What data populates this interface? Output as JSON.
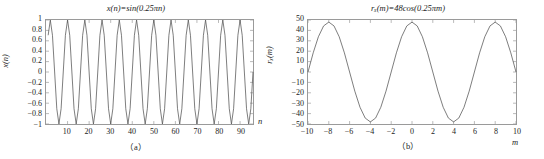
{
  "figure": {
    "panels": [
      {
        "caption": "（a）",
        "title_parts": {
          "func": "x",
          "arg": "n",
          "eq": "=sin(0.25π",
          "argend": "n)"
        },
        "title_text": "x(n)=sin(0.25πn)",
        "ylabel": "x(n)",
        "xlabel": "n",
        "yticks": [
          "1",
          "0.8",
          "0.6",
          "0.4",
          "0.2",
          "0",
          "−0.2",
          "−0.4",
          "−0.6",
          "−0.8",
          "−1"
        ],
        "xticks": [
          "10",
          "20",
          "30",
          "40",
          "50",
          "60",
          "70",
          "80",
          "90"
        ]
      },
      {
        "caption": "（b）",
        "title_text": "rₓ(m)=48cos(0.25πm)",
        "ylabel": "rₓ(m)",
        "xlabel": "m",
        "yticks": [
          "50",
          "40",
          "30",
          "20",
          "10",
          "0",
          "−10",
          "−20",
          "−30",
          "−40",
          "−50"
        ],
        "xticks": [
          "−10",
          "−8",
          "−6",
          "−4",
          "−2",
          "0",
          "2",
          "4",
          "6",
          "8",
          "10"
        ]
      }
    ]
  },
  "chart_data": [
    {
      "type": "line",
      "title": "x(n)=sin(0.25πn)",
      "xlabel": "n",
      "ylabel": "x(n)",
      "xlim": [
        0,
        96
      ],
      "ylim": [
        -1,
        1
      ],
      "xticks": [
        10,
        20,
        30,
        40,
        50,
        60,
        70,
        80,
        90
      ],
      "yticks": [
        -1,
        -0.8,
        -0.6,
        -0.4,
        -0.2,
        0,
        0.2,
        0.4,
        0.6,
        0.8,
        1
      ],
      "grid": false,
      "legend": null,
      "formula": "x(n) = sin(0.25*pi*n)",
      "sample_period": 8,
      "amplitude": 1,
      "n_cycles": 12,
      "series": [
        {
          "name": "x(n)",
          "color": "#5a5a5a",
          "x": [
            1,
            2,
            3,
            4,
            5,
            6,
            7,
            8,
            9,
            10,
            11,
            12,
            13,
            14,
            15,
            16,
            17,
            18,
            19,
            20,
            21,
            22,
            23,
            24,
            25,
            26,
            27,
            28,
            29,
            30,
            31,
            32,
            33,
            34,
            35,
            36,
            37,
            38,
            39,
            40,
            41,
            42,
            43,
            44,
            45,
            46,
            47,
            48,
            49,
            50,
            51,
            52,
            53,
            54,
            55,
            56,
            57,
            58,
            59,
            60,
            61,
            62,
            63,
            64,
            65,
            66,
            67,
            68,
            69,
            70,
            71,
            72,
            73,
            74,
            75,
            76,
            77,
            78,
            79,
            80,
            81,
            82,
            83,
            84,
            85,
            86,
            87,
            88,
            89,
            90,
            91,
            92,
            93,
            94,
            95,
            96
          ],
          "y": [
            0.707,
            1,
            0.707,
            0,
            -0.707,
            -1,
            -0.707,
            0,
            0.707,
            1,
            0.707,
            0,
            -0.707,
            -1,
            -0.707,
            0,
            0.707,
            1,
            0.707,
            0,
            -0.707,
            -1,
            -0.707,
            0,
            0.707,
            1,
            0.707,
            0,
            -0.707,
            -1,
            -0.707,
            0,
            0.707,
            1,
            0.707,
            0,
            -0.707,
            -1,
            -0.707,
            0,
            0.707,
            1,
            0.707,
            0,
            -0.707,
            -1,
            -0.707,
            0,
            0.707,
            1,
            0.707,
            0,
            -0.707,
            -1,
            -0.707,
            0,
            0.707,
            1,
            0.707,
            0,
            -0.707,
            -1,
            -0.707,
            0,
            0.707,
            1,
            0.707,
            0,
            -0.707,
            -1,
            -0.707,
            0,
            0.707,
            1,
            0.707,
            0,
            -0.707,
            -1,
            -0.707,
            0,
            0.707,
            1,
            0.707,
            0,
            -0.707,
            -1,
            -0.707,
            0,
            0.707,
            1,
            0.707,
            0,
            -0.707,
            -1,
            -0.707,
            0
          ]
        }
      ]
    },
    {
      "type": "line",
      "title": "rₓ(m)=48cos(0.25πm)",
      "xlabel": "m",
      "ylabel": "rₓ(m)",
      "xlim": [
        -10,
        10
      ],
      "ylim": [
        -50,
        50
      ],
      "xticks": [
        -10,
        -8,
        -6,
        -4,
        -2,
        0,
        2,
        4,
        6,
        8,
        10
      ],
      "yticks": [
        -50,
        -40,
        -30,
        -20,
        -10,
        0,
        10,
        20,
        30,
        40,
        50
      ],
      "grid": false,
      "legend": null,
      "formula": "r_x(m) = 48*cos(0.25*pi*m)",
      "amplitude": 48,
      "period": 8,
      "series": [
        {
          "name": "rₓ(m)",
          "color": "#5a5a5a",
          "x": [
            -10,
            -9.5,
            -9,
            -8.5,
            -8,
            -7.5,
            -7,
            -6.5,
            -6,
            -5.5,
            -5,
            -4.5,
            -4,
            -3.5,
            -3,
            -2.5,
            -2,
            -1.5,
            -1,
            -0.5,
            0,
            0.5,
            1,
            1.5,
            2,
            2.5,
            3,
            3.5,
            4,
            4.5,
            5,
            5.5,
            6,
            6.5,
            7,
            7.5,
            8,
            8.5,
            9,
            9.5,
            10
          ],
          "y": [
            0,
            18.4,
            33.9,
            44.3,
            48,
            44.3,
            33.9,
            18.4,
            0,
            -18.4,
            -33.9,
            -44.3,
            -48,
            -44.3,
            -33.9,
            -18.4,
            0,
            18.4,
            33.9,
            44.3,
            48,
            44.3,
            33.9,
            18.4,
            0,
            -18.4,
            -33.9,
            -44.3,
            -48,
            -44.3,
            -33.9,
            -18.4,
            0,
            18.4,
            33.9,
            44.3,
            48,
            44.3,
            33.9,
            18.4,
            0
          ]
        }
      ]
    }
  ]
}
